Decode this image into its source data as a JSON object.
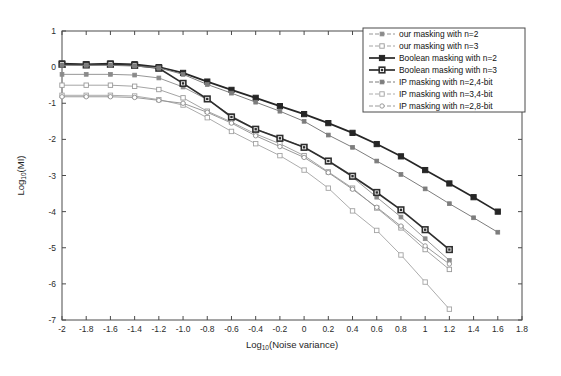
{
  "chart_data": {
    "type": "line",
    "title": "",
    "xlabel": "Log10(Noise variance)",
    "xlabel_base": "Log",
    "xlabel_sub": "10",
    "xlabel_rest": "(Noise variance)",
    "ylabel": "Log10(MI)",
    "ylabel_base": "Log",
    "ylabel_sub": "10",
    "ylabel_rest": "(MI)",
    "xlim": [
      -2,
      1.8
    ],
    "ylim": [
      -7,
      1
    ],
    "grid": false,
    "legend_position": "top-right",
    "xticks": [
      "-2",
      "-1.8",
      "-1.6",
      "-1.4",
      "-1.2",
      "-1.0",
      "-0.8",
      "-0.6",
      "-0.4",
      "-0.2",
      "0",
      "0.2",
      "0.4",
      "0.6",
      "0.8",
      "1",
      "1.2",
      "1.4",
      "1.6",
      "1.8"
    ],
    "xtick_values": [
      -2,
      -1.8,
      -1.6,
      -1.4,
      -1.2,
      -1.0,
      -0.8,
      -0.6,
      -0.4,
      -0.2,
      0,
      0.2,
      0.4,
      0.6,
      0.8,
      1,
      1.2,
      1.4,
      1.6,
      1.8
    ],
    "yticks": [
      "1",
      "0",
      "-1",
      "-2",
      "-3",
      "-4",
      "-5",
      "-6",
      "-7"
    ],
    "ytick_values": [
      1,
      0,
      -1,
      -2,
      -3,
      -4,
      -5,
      -6,
      -7
    ],
    "series": [
      {
        "name": "our masking with n=2",
        "marker": "filled-square-small",
        "color": "#8a8a8a",
        "linewidth": 0.9,
        "x": [
          -2,
          -1.8,
          -1.6,
          -1.4,
          -1.2,
          -1.0,
          -0.8,
          -0.6,
          -0.4,
          -0.2,
          0,
          0.2,
          0.4,
          0.6,
          0.8,
          1.0,
          1.2
        ],
        "values": [
          -0.2,
          -0.2,
          -0.2,
          -0.22,
          -0.3,
          -0.55,
          -0.9,
          -1.35,
          -1.72,
          -1.95,
          -2.22,
          -2.6,
          -3.05,
          -3.6,
          -4.15,
          -4.75,
          -5.35
        ]
      },
      {
        "name": "our masking with n=3",
        "marker": "open-square-small",
        "color": "#9a9a9a",
        "linewidth": 0.9,
        "x": [
          -2,
          -1.8,
          -1.6,
          -1.4,
          -1.2,
          -1.0,
          -0.8,
          -0.6,
          -0.4,
          -0.2,
          0,
          0.2,
          0.4,
          0.6,
          0.8,
          1.0,
          1.2
        ],
        "values": [
          -0.5,
          -0.5,
          -0.5,
          -0.53,
          -0.62,
          -0.85,
          -1.22,
          -1.52,
          -1.85,
          -2.12,
          -2.45,
          -2.9,
          -3.35,
          -3.9,
          -4.45,
          -5.05,
          -5.6
        ]
      },
      {
        "name": "Boolean masking with n=2",
        "marker": "filled-square",
        "color": "#262626",
        "linewidth": 1.7,
        "x": [
          -2,
          -1.8,
          -1.6,
          -1.4,
          -1.2,
          -1.0,
          -0.8,
          -0.6,
          -0.4,
          -0.2,
          0,
          0.2,
          0.4,
          0.6,
          0.8,
          1.0,
          1.2,
          1.4,
          1.6
        ],
        "values": [
          0.1,
          0.08,
          0.1,
          0.08,
          0.0,
          -0.16,
          -0.4,
          -0.63,
          -0.85,
          -1.08,
          -1.3,
          -1.55,
          -1.82,
          -2.13,
          -2.47,
          -2.85,
          -3.22,
          -3.6,
          -4.0
        ]
      },
      {
        "name": "Boolean masking with n=3",
        "marker": "open-square-filled",
        "color": "#2e2e2e",
        "linewidth": 1.7,
        "x": [
          -2,
          -1.8,
          -1.6,
          -1.4,
          -1.2,
          -1.0,
          -0.8,
          -0.6,
          -0.4,
          -0.2,
          0,
          0.2,
          0.4,
          0.6,
          0.8,
          1.0,
          1.2
        ],
        "values": [
          0.08,
          0.06,
          0.08,
          0.05,
          -0.03,
          -0.45,
          -0.88,
          -1.38,
          -1.72,
          -1.97,
          -2.22,
          -2.6,
          -3.02,
          -3.47,
          -3.95,
          -4.5,
          -5.05
        ]
      },
      {
        "name": "IP masking with n=2,4-bit",
        "marker": "filled-square-small",
        "color": "#7d7d7d",
        "linewidth": 1.0,
        "x": [
          -2,
          -1.8,
          -1.6,
          -1.4,
          -1.2,
          -1.0,
          -0.8,
          -0.6,
          -0.4,
          -0.2,
          0,
          0.2,
          0.4,
          0.6,
          0.8,
          1.0,
          1.2,
          1.4,
          1.6
        ],
        "values": [
          0.05,
          0.05,
          0.05,
          0.03,
          -0.02,
          -0.2,
          -0.48,
          -0.72,
          -0.97,
          -1.22,
          -1.5,
          -1.88,
          -2.22,
          -2.6,
          -2.97,
          -3.37,
          -3.78,
          -4.17,
          -4.57
        ]
      },
      {
        "name": "IP masking with n=3,4-bit",
        "marker": "open-square-small",
        "color": "#a3a3a3",
        "linewidth": 0.9,
        "x": [
          -2,
          -1.8,
          -1.6,
          -1.4,
          -1.2,
          -1.0,
          -0.8,
          -0.6,
          -0.4,
          -0.2,
          0,
          0.2,
          0.4,
          0.6,
          0.8,
          1.0,
          1.2
        ],
        "values": [
          -0.78,
          -0.78,
          -0.78,
          -0.8,
          -0.9,
          -1.05,
          -1.4,
          -1.78,
          -2.12,
          -2.45,
          -2.85,
          -3.35,
          -3.98,
          -4.52,
          -5.2,
          -5.95,
          -6.7
        ]
      },
      {
        "name": "IP masking with n=2,8-bit",
        "marker": "open-circle-small",
        "color": "#8f8f8f",
        "linewidth": 0.9,
        "x": [
          -2,
          -1.8,
          -1.6,
          -1.4,
          -1.2,
          -1.0,
          -0.8,
          -0.6,
          -0.4,
          -0.2,
          0,
          0.2,
          0.4,
          0.6,
          0.8,
          1.0,
          1.2
        ],
        "values": [
          -0.82,
          -0.82,
          -0.82,
          -0.84,
          -0.92,
          -1.0,
          -1.25,
          -1.55,
          -1.9,
          -2.2,
          -2.5,
          -2.92,
          -3.38,
          -3.88,
          -4.4,
          -4.95,
          -5.45
        ]
      }
    ]
  },
  "legend": {
    "items": [
      "our masking with n=2",
      "our masking with n=3",
      "Boolean masking with n=2",
      "Boolean masking with n=3",
      "IP masking with n=2,4-bit",
      "IP masking with n=3,4-bit",
      "IP masking with n=2,8-bit"
    ]
  }
}
